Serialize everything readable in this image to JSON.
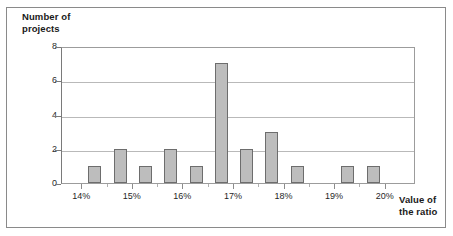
{
  "chart_data": {
    "type": "bar",
    "title": "",
    "subtitle": "",
    "ylabel": "Number of\nprojects",
    "xlabel": "Value of\nthe ratio",
    "ylim": [
      0,
      8
    ],
    "ytick_labels": [
      "0",
      "2",
      "4",
      "6",
      "8"
    ],
    "ytick_values": [
      0,
      2,
      4,
      6,
      8
    ],
    "xtick_labels": [
      "14%",
      "15%",
      "16%",
      "17%",
      "18%",
      "19%",
      "20%"
    ],
    "xtick_values": [
      14,
      15,
      16,
      17,
      18,
      19,
      20
    ],
    "xlim": [
      13.6,
      20.6
    ],
    "grid": "horizontal",
    "legend": "none",
    "bar_fill_color": "#bdbdbd",
    "bar_edge_color": "#6d6d6d",
    "x": [
      14.25,
      14.75,
      15.25,
      15.75,
      16.25,
      16.75,
      17.25,
      17.75,
      18.25,
      19.25,
      19.75
    ],
    "values": [
      1,
      2,
      1,
      2,
      1,
      7,
      2,
      3,
      1,
      1,
      1
    ],
    "categories": [
      "14.25%",
      "14.75%",
      "15.25%",
      "15.75%",
      "16.25%",
      "16.75%",
      "17.25%",
      "17.75%",
      "18.25%",
      "19.25%",
      "19.75%"
    ]
  }
}
